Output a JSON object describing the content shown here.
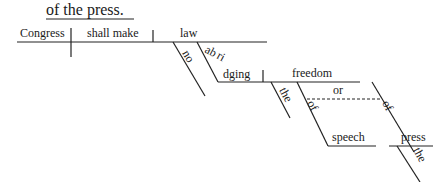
{
  "header": {
    "text": "of the press."
  },
  "diagram": {
    "subject": "Congress",
    "verb": "shall make",
    "object": "law",
    "modifiers": {
      "no": "no",
      "abridging": "abridging",
      "freedom": "freedom",
      "the_freedom": "the",
      "of_speech": "of",
      "conjunction": "or",
      "of_press": "of",
      "speech": "speech",
      "press": "press",
      "the_press": "the"
    }
  }
}
